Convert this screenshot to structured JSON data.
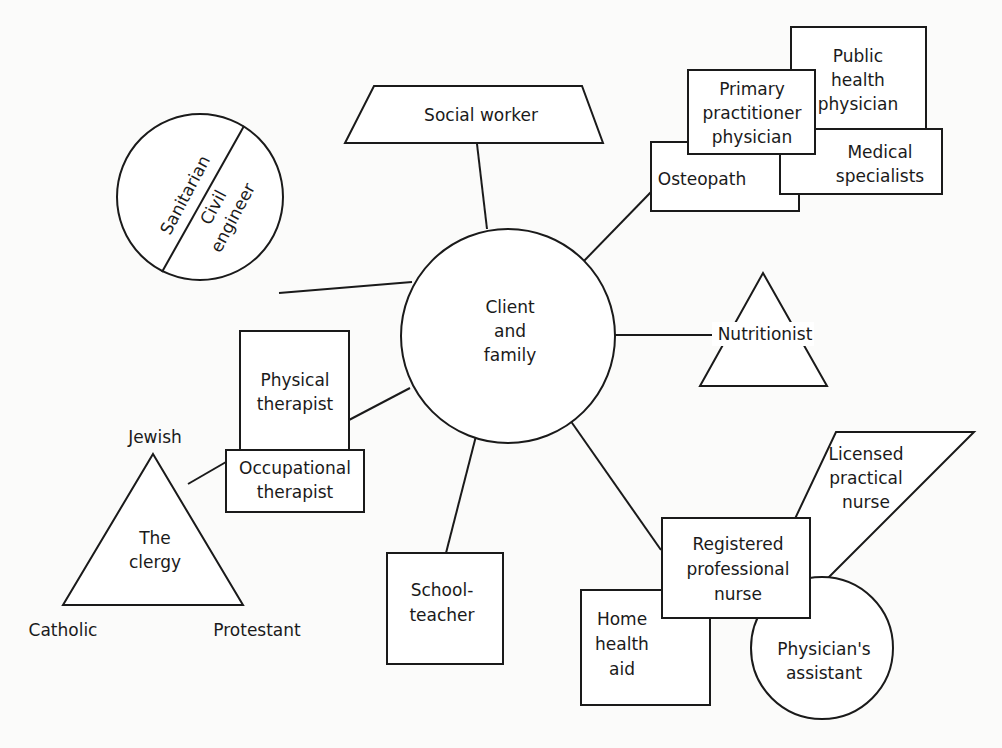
{
  "diagram": {
    "center": {
      "id": "client-and-family",
      "shape": "circle",
      "lines": [
        "Client",
        "and",
        "family"
      ]
    },
    "nodes": [
      {
        "id": "social-worker",
        "shape": "trapezoid",
        "lines": [
          "Social worker"
        ],
        "connects_to": "client-and-family"
      },
      {
        "id": "sanitarian-civil-engineer",
        "shape": "split-circle",
        "sections": [
          {
            "id": "sanitarian",
            "lines": [
              "Sanitarian"
            ]
          },
          {
            "id": "civil-engineer",
            "lines": [
              "Civil",
              "engineer"
            ]
          }
        ],
        "connects_to": "client-and-family"
      },
      {
        "id": "physician-group",
        "shape": "stacked-rectangles",
        "members": [
          {
            "id": "public-health-physician",
            "lines": [
              "Public",
              "health",
              "physician"
            ]
          },
          {
            "id": "primary-practitioner-physician",
            "lines": [
              "Primary",
              "practitioner",
              "physician"
            ]
          },
          {
            "id": "medical-specialists",
            "lines": [
              "Medical",
              "specialists"
            ]
          },
          {
            "id": "osteopath",
            "lines": [
              "Osteopath"
            ]
          }
        ],
        "connects_to": "client-and-family"
      },
      {
        "id": "nutritionist",
        "shape": "triangle",
        "lines": [
          "Nutritionist"
        ],
        "connects_to": "client-and-family"
      },
      {
        "id": "therapist-group",
        "shape": "stacked-rectangles",
        "members": [
          {
            "id": "physical-therapist",
            "lines": [
              "Physical",
              "therapist"
            ]
          },
          {
            "id": "occupational-therapist",
            "lines": [
              "Occupational",
              "therapist"
            ]
          }
        ],
        "connects_to": "client-and-family"
      },
      {
        "id": "clergy",
        "shape": "triangle",
        "lines": [
          "The",
          "clergy"
        ],
        "vertex_labels": {
          "top": "Jewish",
          "bottom_left": "Catholic",
          "bottom_right": "Protestant"
        },
        "connects_to": "occupational-therapist"
      },
      {
        "id": "schoolteacher",
        "shape": "rectangle",
        "lines": [
          "School-",
          "teacher"
        ],
        "connects_to": "client-and-family"
      },
      {
        "id": "nursing-group",
        "shape": "cluster",
        "members": [
          {
            "id": "registered-professional-nurse",
            "shape": "rectangle",
            "lines": [
              "Registered",
              "professional",
              "nurse"
            ]
          },
          {
            "id": "licensed-practical-nurse",
            "shape": "parallelogram",
            "lines": [
              "Licensed",
              "practical",
              "nurse"
            ]
          },
          {
            "id": "home-health-aid",
            "shape": "rectangle",
            "lines": [
              "Home",
              "health",
              "aid"
            ]
          },
          {
            "id": "physicians-assistant",
            "shape": "circle",
            "lines": [
              "Physician's",
              "assistant"
            ]
          }
        ],
        "connects_to": "client-and-family"
      }
    ]
  }
}
